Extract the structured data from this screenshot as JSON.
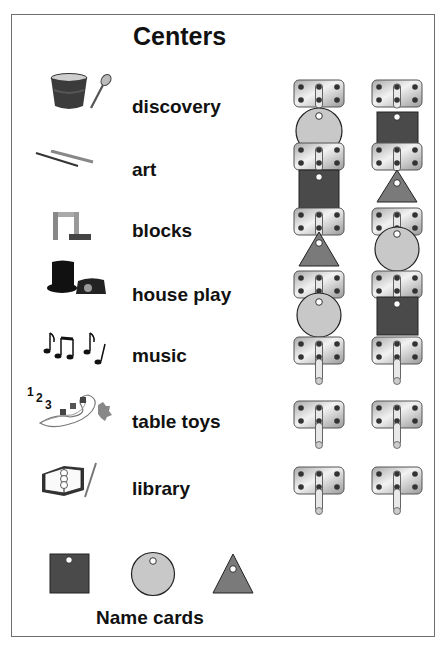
{
  "title": "Centers",
  "centers": [
    {
      "label": "discovery",
      "icon": "bucket-and-spoon-icon"
    },
    {
      "label": "art",
      "icon": "pencil-and-brush-icon"
    },
    {
      "label": "blocks",
      "icon": "blocks-icon"
    },
    {
      "label": "house play",
      "icon": "top-hat-and-telephone-icon"
    },
    {
      "label": "music",
      "icon": "music-notes-icon"
    },
    {
      "label": "table toys",
      "icon": "beads-and-puzzle-icon"
    },
    {
      "label": "library",
      "icon": "book-and-pencil-icon"
    }
  ],
  "hooks": {
    "column_1": [
      "circle",
      "square",
      "triangle",
      "circle",
      "empty",
      "empty",
      "empty"
    ],
    "column_2": [
      "square",
      "triangle",
      "circle",
      "square",
      "empty",
      "empty",
      "empty"
    ]
  },
  "name_cards": {
    "label": "Name cards",
    "shapes": [
      "square",
      "circle",
      "triangle"
    ]
  },
  "colors": {
    "square": "#4a4a4a",
    "circle": "#c8c8c8",
    "triangle": "#7a7a7a",
    "plate": "#d6d6d6",
    "frame": "#6e6e6e"
  }
}
